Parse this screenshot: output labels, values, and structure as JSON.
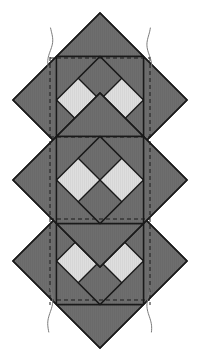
{
  "figure": {
    "canvas": {
      "width": 201,
      "height": 361,
      "background": "#ffffff"
    },
    "colors": {
      "dark_patch": "#6e6e6e",
      "light_patch": "#dedede",
      "outline": "#1a1a1a",
      "dashed_guide": "#1a1a1a",
      "break_line": "#7a7a7a",
      "background": "#ffffff"
    },
    "stroke": {
      "outline_width": 1.4,
      "dash_width": 1.0,
      "dash_pattern": "4 3",
      "break_width": 1.0
    },
    "blocks": [
      {
        "name": "top-block",
        "center_x": 100,
        "center_y": 100,
        "half_diagonal": 87,
        "inner_half": 43.5,
        "pattern": "x-cross"
      },
      {
        "name": "middle-block",
        "center_x": 100,
        "center_y": 180,
        "half_diagonal": 87,
        "inner_half": 43.5,
        "pattern": "x-cross"
      },
      {
        "name": "bottom-block",
        "center_x": 100,
        "center_y": 261,
        "half_diagonal": 87,
        "inner_half": 43.5,
        "pattern": "x-cross"
      }
    ],
    "guides": {
      "vertical_dashed": [
        {
          "name": "left-vertical-guide",
          "x": 50,
          "y1": 57,
          "y2": 305
        },
        {
          "name": "right-vertical-guide",
          "x": 150,
          "y1": 57,
          "y2": 305
        }
      ],
      "horizontal_dashed": [
        {
          "name": "top-horizontal-guide",
          "y": 58,
          "x1": 50,
          "x2": 150
        },
        {
          "name": "upper-mid-horizontal-guide",
          "y": 137,
          "x1": 50,
          "x2": 150
        },
        {
          "name": "lower-mid-horizontal-guide",
          "y": 219,
          "x1": 50,
          "x2": 150
        },
        {
          "name": "bottom-horizontal-guide",
          "y": 300,
          "x1": 50,
          "x2": 150
        }
      ]
    },
    "break_lines": [
      {
        "name": "break-line-top-left",
        "x": 50,
        "y_top": 28,
        "y_bottom": 70
      },
      {
        "name": "break-line-top-right",
        "x": 150,
        "y_top": 28,
        "y_bottom": 70
      },
      {
        "name": "break-line-bottom-left",
        "x": 50,
        "y_top": 288,
        "y_bottom": 332
      },
      {
        "name": "break-line-bottom-right",
        "x": 150,
        "y_top": 288,
        "y_bottom": 332
      }
    ],
    "vertices": {
      "top_point": {
        "x": 100,
        "y": 13
      },
      "bottom_point": {
        "x": 100,
        "y": 348
      },
      "left_point": {
        "x": 13,
        "y": 180
      },
      "right_point": {
        "x": 187,
        "y": 180
      }
    }
  }
}
